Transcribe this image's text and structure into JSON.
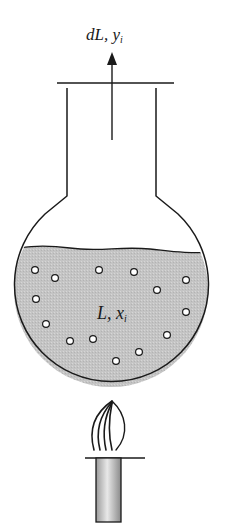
{
  "diagram": {
    "vapor_label": {
      "main": "dL, y",
      "sub": "i"
    },
    "liquid_label": {
      "main": "L, x",
      "sub": "i"
    },
    "colors": {
      "stroke": "#1a1a1a",
      "liquid_fill": "#c4c4c4",
      "bubble_fill": "#ffffff",
      "burner_fill": "#bdbdbd",
      "background": "#ffffff"
    },
    "components": [
      "flask-neck",
      "flask-bulb",
      "liquid",
      "bubbles",
      "vapor-arrow",
      "flame",
      "burner"
    ],
    "bubble_count": 15
  }
}
